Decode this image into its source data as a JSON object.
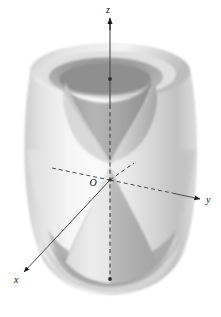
{
  "figure": {
    "background_color": "#ffffff",
    "width": 221,
    "height": 317
  },
  "axes": {
    "origin_label": "O",
    "z_label": "z",
    "y_label": "y",
    "x_label": "x",
    "axis_color": "#4a4a4a",
    "dashed_color": "#3a3a3a",
    "arrow_color": "#1a1a1a"
  },
  "surface": {
    "kind": "hyperboloid-of-one-sheet",
    "inner_kind": "double-cone",
    "fill_light": "#f2f2f2",
    "fill_mid": "#d8d8d8",
    "fill_dark": "#b5b5b5",
    "fill_darker": "#9a9a9a",
    "outline_color": "#c9c9c9"
  },
  "markers": {
    "z_top_dot": "dot",
    "z_bottom_dot": "dot",
    "origin_dot": "dot"
  }
}
